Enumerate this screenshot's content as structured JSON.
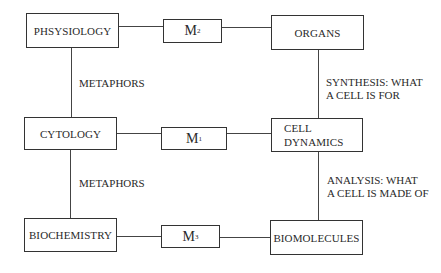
{
  "diagram": {
    "type": "relationship-grid",
    "levels": [
      {
        "left": "PHSYSIOLOGY",
        "model": {
          "base": "M",
          "subscript": "2"
        },
        "right": "ORGANS"
      },
      {
        "left": "CYTOLOGY",
        "model": {
          "base": "M",
          "subscript": "1"
        },
        "right": "CELL\nDYNAMICS"
      },
      {
        "left": "BIOCHEMISTRY",
        "model": {
          "base": "M",
          "subscript": "3"
        },
        "right": "BIOMOLECULES"
      }
    ],
    "left_connectors": [
      "METAPHORS",
      "METAPHORS"
    ],
    "right_connectors": [
      "SYNTHESIS: WHAT\nA CELL IS FOR",
      "ANALYSIS: WHAT\nA CELL IS MADE OF"
    ]
  }
}
